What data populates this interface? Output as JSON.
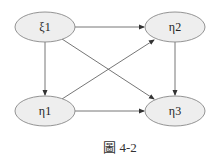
{
  "diagram": {
    "type": "path-diagram",
    "nodes": [
      {
        "id": "xi1",
        "label": "ξ1",
        "cx": 45,
        "cy": 27
      },
      {
        "id": "eta2",
        "label": "η2",
        "cx": 175,
        "cy": 27
      },
      {
        "id": "eta1",
        "label": "η1",
        "cx": 45,
        "cy": 111
      },
      {
        "id": "eta3",
        "label": "η3",
        "cx": 175,
        "cy": 111
      }
    ],
    "edges": [
      {
        "from": "ξ1",
        "to": "η2"
      },
      {
        "from": "ξ1",
        "to": "η1"
      },
      {
        "from": "ξ1",
        "to": "η3"
      },
      {
        "from": "η1",
        "to": "η2"
      },
      {
        "from": "η1",
        "to": "η3"
      },
      {
        "from": "η2",
        "to": "η3"
      }
    ],
    "style": {
      "node_fill": "#eeeeee",
      "node_stroke": "#888888",
      "edge_color": "#555555"
    }
  },
  "caption": "圖 4-2"
}
